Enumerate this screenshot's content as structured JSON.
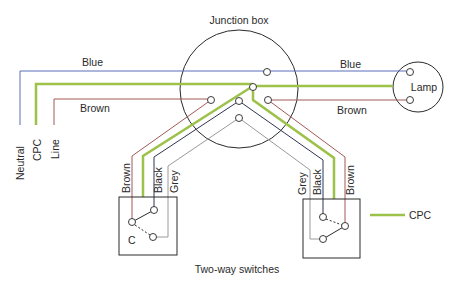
{
  "diagram": {
    "title": "Junction box",
    "caption": "Two-way switches",
    "colors": {
      "blue": "#5a6db8",
      "cpc": "#9dc24a",
      "brown": "#a05a55",
      "black": "#2f3550",
      "grey": "#9a9a9a",
      "outline": "#2a2a2a"
    },
    "supply_labels": {
      "neutral": "Neutral",
      "cpc": "CPC",
      "line": "Line"
    },
    "wire_labels": {
      "blue_left": "Blue",
      "brown_left": "Brown",
      "blue_right": "Blue",
      "brown_right": "Brown"
    },
    "lamp": {
      "label": "Lamp"
    },
    "switch_left": {
      "labels": [
        "Brown",
        "Black",
        "Grey"
      ],
      "common_label": "C"
    },
    "switch_right": {
      "labels": [
        "Grey",
        "Black",
        "Brown"
      ]
    },
    "legend": [
      {
        "label": "CPC",
        "color": "#9dc24a"
      }
    ]
  }
}
